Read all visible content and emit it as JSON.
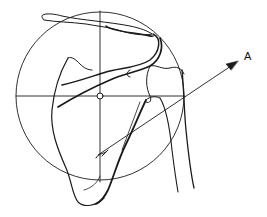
{
  "figure": {
    "labels": {
      "arrow_label": "A"
    },
    "colors": {
      "stroke": "#1a1a1a",
      "background": "#ffffff"
    }
  }
}
